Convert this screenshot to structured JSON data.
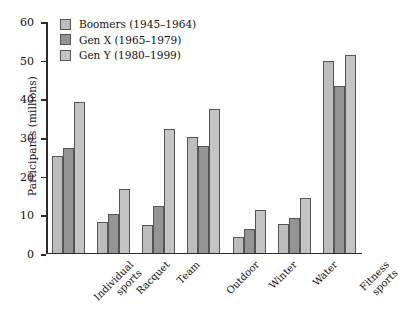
{
  "chart_data": {
    "type": "bar",
    "title": "",
    "xlabel": "",
    "ylabel": "Participants (millions)",
    "ylim": [
      0,
      60
    ],
    "yticks": [
      0,
      10,
      20,
      30,
      40,
      50,
      60
    ],
    "grid": false,
    "legend_position": "top-left",
    "categories": [
      "Individual sports",
      "Racquet",
      "Team",
      "Outdoor",
      "Winter",
      "Water",
      "Fitness sports"
    ],
    "category_lines": [
      [
        "Individual",
        "sports"
      ],
      [
        "Racquet"
      ],
      [
        "Team"
      ],
      [
        "Outdoor"
      ],
      [
        "Winter"
      ],
      [
        "Water"
      ],
      [
        "Fitness",
        "sports"
      ]
    ],
    "series": [
      {
        "name": "Boomers (1945–1964)",
        "color": "#bdbdbd",
        "values": [
          25,
          8,
          7,
          30,
          4,
          7.5,
          49.5
        ]
      },
      {
        "name": "Gen X (1965–1979)",
        "color": "#949494",
        "values": [
          27,
          10,
          12,
          27.5,
          6,
          9,
          43
        ]
      },
      {
        "name": "Gen Y (1980–1999)",
        "color": "#c4c4c4",
        "values": [
          39,
          16.5,
          32,
          37,
          11,
          14,
          51
        ]
      }
    ]
  }
}
